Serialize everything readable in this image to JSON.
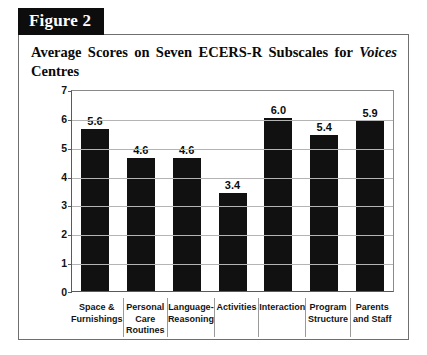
{
  "figure": {
    "tab_label": "Figure 2",
    "title_part1": "Average Scores on Seven ECERS-R Subscales for ",
    "title_emphasis": "Voices",
    "title_part2": " Centres"
  },
  "chart_data": {
    "type": "bar",
    "title": "Average Scores on Seven ECERS-R Subscales for Voices Centres",
    "xlabel": "",
    "ylabel": "",
    "ylim": [
      0,
      7
    ],
    "yticks": [
      0,
      1,
      2,
      3,
      4,
      5,
      6,
      7
    ],
    "ytick_labels": [
      "0",
      "1",
      "2",
      "3",
      "4",
      "5",
      "6",
      "7"
    ],
    "grid": true,
    "legend": false,
    "bar_color": "#111111",
    "categories": [
      "Space & Furnishings",
      "Personal Care Routines",
      "Language-Reasoning",
      "Activities",
      "Interaction",
      "Program Structure",
      "Parents and Staff"
    ],
    "category_lines": [
      [
        "Space &",
        "Furnishings"
      ],
      [
        "Personal",
        "Care",
        "Routines"
      ],
      [
        "Language-",
        "Reasoning"
      ],
      [
        "Activities"
      ],
      [
        "Interaction"
      ],
      [
        "Program",
        "Structure"
      ],
      [
        "Parents",
        "and Staff"
      ]
    ],
    "values": [
      5.6,
      4.6,
      4.6,
      3.4,
      6.0,
      5.4,
      5.9
    ],
    "value_labels": [
      "5.6",
      "4.6",
      "4.6",
      "3.4",
      "6.0",
      "5.4",
      "5.9"
    ]
  }
}
